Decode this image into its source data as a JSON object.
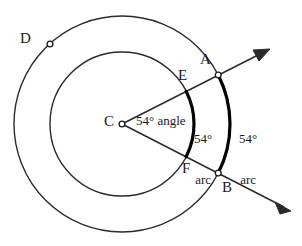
{
  "figure": {
    "background_color": "#ffffff",
    "stroke_color": "#2a2a2a",
    "highlight_color": "#000000",
    "width": 302,
    "height": 246
  },
  "geometry": {
    "center": {
      "x": 122,
      "y": 124
    },
    "inner_radius": 72,
    "outer_radius": 108,
    "ray_upper_angle_deg": -27,
    "ray_lower_angle_deg": 27,
    "central_angle_deg": 54,
    "point_d_angle_deg": 228
  },
  "points": [
    {
      "id": "C",
      "label": "C",
      "label_x": 104,
      "label_y": 114,
      "marker": true,
      "marker_x": 122,
      "marker_y": 124
    },
    {
      "id": "D",
      "label": "D",
      "label_x": 20,
      "label_y": 31,
      "marker": true,
      "marker_x": 50,
      "marker_y": 44
    },
    {
      "id": "A",
      "label": "A",
      "label_x": 200,
      "label_y": 52,
      "marker": true,
      "marker_x": 218,
      "marker_y": 75
    },
    {
      "id": "E",
      "label": "E",
      "label_x": 178,
      "label_y": 68,
      "marker": false,
      "marker_x": 186,
      "marker_y": 91
    },
    {
      "id": "F",
      "label": "F",
      "label_x": 182,
      "label_y": 161,
      "marker": false,
      "marker_x": 186,
      "marker_y": 157
    },
    {
      "id": "B",
      "label": "B",
      "label_x": 222,
      "label_y": 180,
      "marker": true,
      "marker_x": 218,
      "marker_y": 173
    }
  ],
  "annotations": [
    {
      "id": "angle",
      "line1": "54°",
      "line2": "angle",
      "inline": true,
      "x": 136,
      "y": 114
    },
    {
      "id": "inner-arc",
      "line1": "54°",
      "line2": "arc",
      "inline": false,
      "x": 194,
      "y": 108
    },
    {
      "id": "outer-arc",
      "line1": "54°",
      "line2": "arc",
      "inline": false,
      "x": 239,
      "y": 108
    }
  ],
  "legend": {
    "degree_symbol": "°",
    "angle_word": "angle",
    "arc_word": "arc",
    "value": "54"
  }
}
